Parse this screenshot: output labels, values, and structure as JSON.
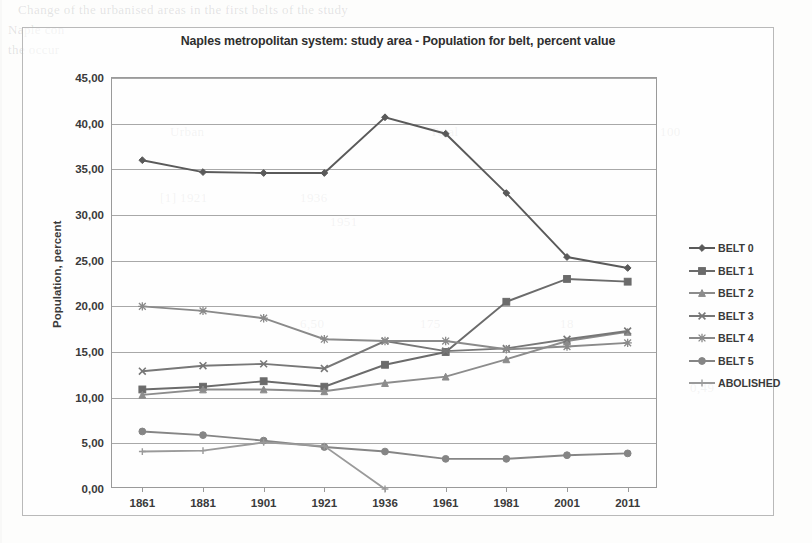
{
  "chart_data": {
    "type": "line",
    "title": "Naples metropolitan system: study area - Population for belt, percent value",
    "xlabel": "",
    "ylabel": "Population, percent",
    "categories": [
      "1861",
      "1881",
      "1901",
      "1921",
      "1936",
      "1961",
      "1981",
      "2001",
      "2011"
    ],
    "ylim": [
      0,
      45
    ],
    "ytick_labels": [
      "0,00",
      "5,00",
      "10,00",
      "15,00",
      "20,00",
      "25,00",
      "30,00",
      "35,00",
      "40,00",
      "45,00"
    ],
    "ytick_values": [
      0,
      5,
      10,
      15,
      20,
      25,
      30,
      35,
      40,
      45
    ],
    "grid": true,
    "legend_position": "right",
    "series": [
      {
        "name": "BELT 0",
        "marker": "diamond",
        "color": "#5a5a5a",
        "values": [
          36.0,
          34.7,
          34.6,
          34.6,
          40.7,
          38.9,
          32.4,
          25.4,
          24.2
        ]
      },
      {
        "name": "BELT 1",
        "marker": "square",
        "color": "#6b6b6b",
        "values": [
          10.9,
          11.2,
          11.8,
          11.2,
          13.6,
          15.0,
          20.5,
          23.0,
          22.7
        ]
      },
      {
        "name": "BELT 2",
        "marker": "triangle",
        "color": "#8c8c8c",
        "values": [
          10.3,
          10.9,
          10.9,
          10.7,
          11.6,
          12.3,
          14.2,
          16.2,
          17.2
        ]
      },
      {
        "name": "BELT 3",
        "marker": "cross",
        "color": "#777777",
        "values": [
          12.9,
          13.5,
          13.7,
          13.2,
          16.2,
          15.1,
          15.4,
          16.4,
          17.3
        ]
      },
      {
        "name": "BELT 4",
        "marker": "asterisk",
        "color": "#8a8a8a",
        "values": [
          20.0,
          19.5,
          18.7,
          16.4,
          16.2,
          16.2,
          15.3,
          15.6,
          16.0
        ]
      },
      {
        "name": "BELT 5",
        "marker": "circle",
        "color": "#858585",
        "values": [
          6.3,
          5.9,
          5.3,
          4.6,
          4.1,
          3.3,
          3.3,
          3.7,
          3.9
        ]
      },
      {
        "name": "ABOLISHED",
        "marker": "plus",
        "color": "#9a9a9a",
        "values": [
          4.1,
          4.2,
          5.1,
          4.7,
          0.0,
          null,
          null,
          null,
          null
        ]
      }
    ]
  },
  "legend": {
    "items": [
      "BELT 0",
      "BELT 1",
      "BELT 2",
      "BELT 3",
      "BELT 4",
      "BELT 5",
      "ABOLISHED"
    ]
  },
  "page_ghost": {
    "top_left": "Change of the urbanised areas in the first belts of the study",
    "top_left2": "Naple  con",
    "top_left3": "the occur",
    "row_a": "Urban",
    "row_b": "Total",
    "row_c": "[1] 1921",
    "row_d": "1936",
    "row_e": "1951",
    "row_f": "175",
    "row_g": "6,50",
    "row_h": "18",
    "row_i": "100",
    "row_j": "0,49"
  },
  "colors": {
    "grid": "#a8a8a8",
    "axis": "#9a9a9a",
    "text": "#3a3a3a",
    "frame": "#b9b9b9"
  }
}
